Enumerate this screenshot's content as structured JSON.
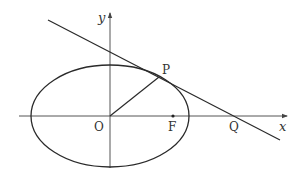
{
  "diagram": {
    "type": "ellipse-tangent",
    "colors": {
      "stroke": "#2a2a2a",
      "axis": "#555555",
      "text": "#333333",
      "background": "#ffffff"
    },
    "axes": {
      "x_label": "x",
      "y_label": "y"
    },
    "points": {
      "origin": "O",
      "point_on_ellipse": "P",
      "focus": "F",
      "tangent_x_intercept": "Q"
    },
    "elements": [
      "ellipse centered at O",
      "tangent line to ellipse at P",
      "segment OP",
      "focus F on positive x-axis",
      "Q: intersection of tangent with x-axis"
    ]
  }
}
